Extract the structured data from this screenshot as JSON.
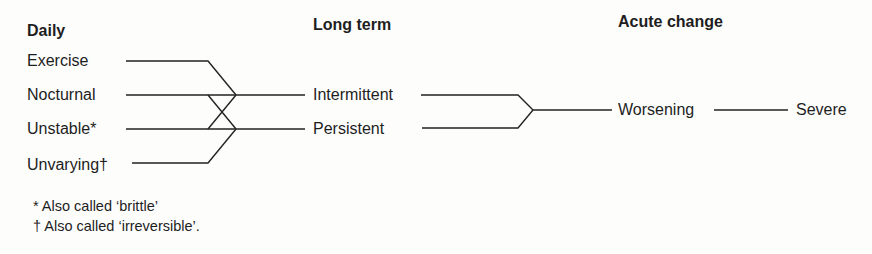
{
  "columns": {
    "daily": {
      "header": "Daily",
      "items": [
        "Exercise",
        "Nocturnal",
        "Unstable*",
        "Unvarying†"
      ]
    },
    "long_term": {
      "header": "Long term",
      "items": [
        "Intermittent",
        "Persistent"
      ]
    },
    "acute_change": {
      "header": "Acute change",
      "items": [
        "Worsening",
        "Severe"
      ]
    }
  },
  "footnotes": [
    "* Also called ‘brittle’",
    "† Also called ‘irreversible’."
  ],
  "connections": [
    {
      "from": "Exercise",
      "to": "Intermittent"
    },
    {
      "from": "Nocturnal",
      "to": "Intermittent"
    },
    {
      "from": "Nocturnal",
      "to": "Persistent"
    },
    {
      "from": "Unstable*",
      "to": "Intermittent"
    },
    {
      "from": "Unstable*",
      "to": "Persistent"
    },
    {
      "from": "Unvarying†",
      "to": "Persistent"
    },
    {
      "from": "Intermittent",
      "to": "Worsening"
    },
    {
      "from": "Persistent",
      "to": "Worsening"
    },
    {
      "from": "Worsening",
      "to": "Severe"
    }
  ]
}
